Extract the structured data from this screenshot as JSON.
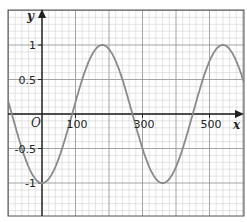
{
  "chart_data": {
    "type": "line",
    "title": "",
    "xlabel": "x",
    "ylabel": "y",
    "origin_label": "O",
    "function": "y = -cos(x°)",
    "xlim": [
      -100,
      605
    ],
    "ylim": [
      -1.5,
      1.45
    ],
    "x_ticks": [
      100,
      300,
      500
    ],
    "x_tick_labels": [
      "100",
      "300",
      "500"
    ],
    "y_ticks": [
      1,
      0.5,
      -0.5,
      -1
    ],
    "y_tick_labels": [
      "1",
      "0.5",
      "-0.5",
      "-1"
    ],
    "grid": true,
    "major_grid_x_step": 100,
    "minor_grid_x_step": 20,
    "major_grid_y_step": 0.5,
    "minor_grid_y_step": 0.1,
    "series": [
      {
        "name": "y = -cos x",
        "x": [
          -100,
          -90,
          0,
          90,
          180,
          270,
          360,
          450,
          540,
          605
        ],
        "y": [
          0.17,
          0,
          -1,
          0,
          1,
          0,
          -1,
          0,
          1,
          0.42
        ]
      }
    ],
    "colors": {
      "curve": "#8a8a8a",
      "axis": "#222222",
      "major_grid": "#9a9a9a",
      "minor_grid": "#c8c8c8",
      "frame": "#555555"
    }
  }
}
